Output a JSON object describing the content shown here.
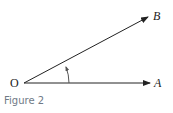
{
  "figure": {
    "caption": "Figure 2",
    "labels": {
      "origin": "O",
      "point_a": "A",
      "point_b": "B"
    },
    "colors": {
      "lines": "#222222",
      "caption": "#6f7a86"
    }
  }
}
